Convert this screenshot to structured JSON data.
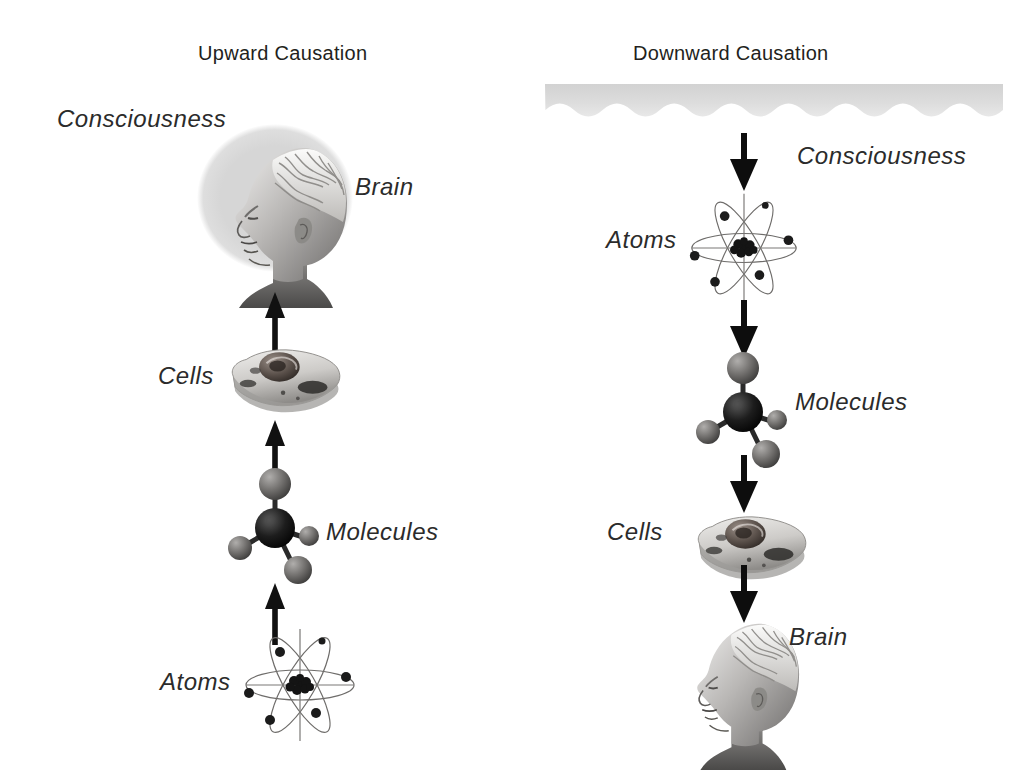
{
  "figure": {
    "background_color": "#ffffff",
    "ink_color": "#231f20",
    "band_color": "#dcdcdc",
    "halo_color": "#d8d8d8"
  },
  "columns": [
    {
      "id": "upward",
      "title": "Upward Causation",
      "direction": "up",
      "levels": [
        {
          "label": "Consciousness",
          "icon": "halo-icon"
        },
        {
          "label": "Brain",
          "icon": "head-brain-icon"
        },
        {
          "label": "Cells",
          "icon": "cell-icon"
        },
        {
          "label": "Molecules",
          "icon": "molecule-icon"
        },
        {
          "label": "Atoms",
          "icon": "atom-icon"
        }
      ],
      "arrows": 3,
      "arrow_direction": "up"
    },
    {
      "id": "downward",
      "title": "Downward Causation",
      "direction": "down",
      "levels": [
        {
          "label": "Consciousness",
          "icon": "wavy-band-icon"
        },
        {
          "label": "Atoms",
          "icon": "atom-icon"
        },
        {
          "label": "Molecules",
          "icon": "molecule-icon"
        },
        {
          "label": "Cells",
          "icon": "cell-icon"
        },
        {
          "label": "Brain",
          "icon": "head-brain-icon"
        }
      ],
      "arrows": 4,
      "arrow_direction": "down"
    }
  ],
  "labels": {
    "left_title": "Upward Causation",
    "right_title": "Downward Causation",
    "left_consciousness": "Consciousness",
    "left_brain": "Brain",
    "left_cells": "Cells",
    "left_molecules": "Molecules",
    "left_atoms": "Atoms",
    "right_consciousness": "Consciousness",
    "right_atoms": "Atoms",
    "right_molecules": "Molecules",
    "right_cells": "Cells",
    "right_brain": "Brain"
  }
}
